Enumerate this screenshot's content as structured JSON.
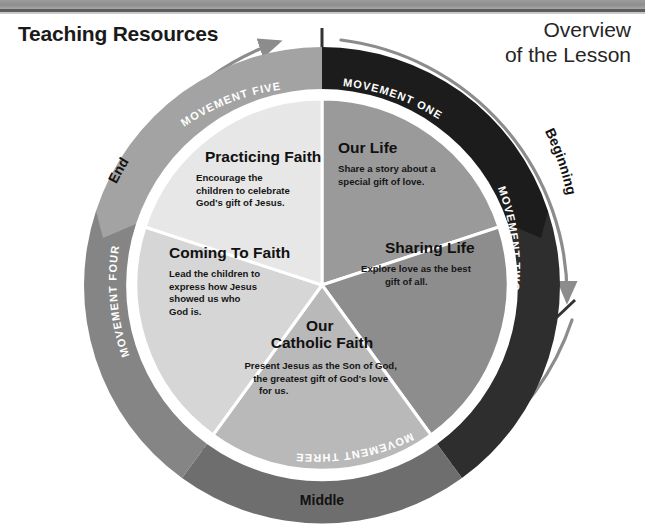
{
  "header": {
    "left_title": "Teaching Resources",
    "right_title": "Overview\nof the Lesson"
  },
  "diagram": {
    "type": "circular-process-wheel",
    "segments": [
      {
        "id": "our-life",
        "title": "Our Life",
        "body": "Share a story about a\nspecial gift of love.",
        "color": "#9a9a9a"
      },
      {
        "id": "sharing-life",
        "title": "Sharing Life",
        "body": "Explore love as the best\ngift of all.",
        "color": "#8d8d8d"
      },
      {
        "id": "our-catholic-faith",
        "title": "Our\nCatholic Faith",
        "body": "Present Jesus as the Son of God,\nthe greatest gift of God's love\nfor us.",
        "color": "#b9b9b9"
      },
      {
        "id": "coming-to-faith",
        "title": "Coming To Faith",
        "body": "Lead the children to\nexpress how Jesus\nshowed us who\nGod is.",
        "color": "#d6d6d6"
      },
      {
        "id": "practicing-faith",
        "title": "Practicing Faith",
        "body": "Encourage the\nchildren to celebrate\nGod's gift of Jesus.",
        "color": "#e7e7e7"
      }
    ],
    "ring_bands": [
      {
        "id": "movement-one",
        "label": "MOVEMENT ONE",
        "color": "#1c1c1c",
        "text_color": "#ffffff"
      },
      {
        "id": "movement-two",
        "label": "MOVEMENT TWO",
        "color": "#2e2e2e",
        "text_color": "#ffffff"
      },
      {
        "id": "movement-three",
        "label": "MOVEMENT THREE",
        "color": "#6e6e6e",
        "text_color": "#ffffff"
      },
      {
        "id": "movement-four",
        "label": "MOVEMENT FOUR",
        "color": "#858585",
        "text_color": "#ffffff"
      },
      {
        "id": "movement-five",
        "label": "MOVEMENT FIVE",
        "color": "#a3a3a3",
        "text_color": "#ffffff"
      }
    ],
    "phase_labels": [
      {
        "id": "beginning",
        "label": "Beginning"
      },
      {
        "id": "middle",
        "label": "Middle"
      },
      {
        "id": "end",
        "label": "End"
      }
    ]
  }
}
